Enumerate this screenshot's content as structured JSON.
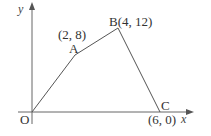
{
  "diagram": {
    "type": "coordinate-polygon",
    "axes": {
      "x_label": "x",
      "y_label": "y"
    },
    "origin_label": "O",
    "points": [
      {
        "name": "O",
        "coord_label": "",
        "x": 0,
        "y": 0
      },
      {
        "name": "A",
        "coord_label": "(2, 8)",
        "x": 2,
        "y": 8
      },
      {
        "name": "B",
        "coord_label": "B(4, 12)",
        "x": 4,
        "y": 12
      },
      {
        "name": "C",
        "coord_label": "(6, 0)",
        "x": 6,
        "y": 0
      }
    ],
    "labels": {
      "A": "A",
      "A_coord": "(2, 8)",
      "B": "B(4, 12)",
      "C": "C",
      "C_coord": "(6, 0)"
    },
    "colors": {
      "line": "#555555",
      "text": "#333333"
    }
  }
}
